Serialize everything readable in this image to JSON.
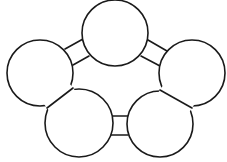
{
  "diagram": {
    "type": "ring-of-circles",
    "stroke_color": "#1a1a1a",
    "background": "#ffffff",
    "nodes": [
      {
        "id": "top",
        "cx": 115,
        "cy": 33,
        "r": 33
      },
      {
        "id": "left",
        "cx": 40,
        "cy": 73,
        "r": 33
      },
      {
        "id": "right",
        "cx": 192,
        "cy": 73,
        "r": 33
      },
      {
        "id": "bottom-left",
        "cx": 79,
        "cy": 123,
        "r": 34
      },
      {
        "id": "bottom-right",
        "cx": 160,
        "cy": 124,
        "r": 33
      }
    ],
    "bridges": [
      {
        "between": [
          "left",
          "top"
        ],
        "lines": [
          [
            65,
            49,
            83,
            39
          ],
          [
            73,
            65,
            89,
            56
          ]
        ]
      },
      {
        "between": [
          "top",
          "right"
        ],
        "lines": [
          [
            148,
            40,
            167,
            51
          ],
          [
            141,
            56,
            160,
            66
          ]
        ]
      },
      {
        "between": [
          "bottom-left",
          "bottom-right"
        ],
        "lines": [
          [
            111,
            116,
            128,
            116
          ],
          [
            111,
            135,
            128,
            135
          ]
        ]
      }
    ],
    "shared_edges": [
      {
        "between": [
          "left",
          "bottom-left"
        ],
        "line": [
          73,
          88,
          47,
          108
        ]
      },
      {
        "between": [
          "right",
          "bottom-right"
        ],
        "line": [
          160,
          90,
          192,
          108
        ]
      }
    ]
  }
}
